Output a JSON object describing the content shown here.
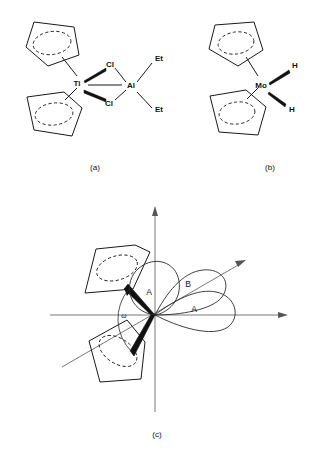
{
  "figure": {
    "background_color": "#ffffff",
    "line_color": "#1a1a1a"
  },
  "panels": [
    {
      "id": "a",
      "caption": "(a)",
      "description": "Titanocene dichloride aluminium alkyl bridged complex",
      "atoms": [
        {
          "name": "Ti",
          "label": "Ti"
        },
        {
          "name": "Cl-top",
          "label": "Cl"
        },
        {
          "name": "Cl-bottom",
          "label": "Cl"
        },
        {
          "name": "Al",
          "label": "Al"
        },
        {
          "name": "Et-top",
          "label": "Et"
        },
        {
          "name": "Et-bottom",
          "label": "Et"
        }
      ],
      "ligands": [
        {
          "name": "cp-ring-upper",
          "label": "Cp"
        },
        {
          "name": "cp-ring-lower",
          "label": "Cp"
        }
      ]
    },
    {
      "id": "b",
      "caption": "(b)",
      "description": "Molybdenocene dihydride",
      "atoms": [
        {
          "name": "Mo",
          "label": "Mo"
        },
        {
          "name": "H-top",
          "label": "H"
        },
        {
          "name": "H-bottom",
          "label": "H"
        }
      ],
      "ligands": [
        {
          "name": "cp-ring-upper",
          "label": "Cp"
        },
        {
          "name": "cp-ring-lower",
          "label": "Cp"
        }
      ]
    },
    {
      "id": "c",
      "caption": "(c)",
      "description": "Frontier orbital lobes of a bent metallocene with interannular angle omega",
      "angle_label": "ω",
      "orbital_lobes": [
        {
          "name": "lobe-upper",
          "label": "A"
        },
        {
          "name": "lobe-diagonal",
          "label": "B"
        },
        {
          "name": "lobe-right",
          "label": "A"
        }
      ],
      "axes": [
        {
          "name": "y-axis",
          "direction": "up"
        },
        {
          "name": "x-axis",
          "direction": "right"
        },
        {
          "name": "z-axis",
          "direction": "diagonal-up-right"
        }
      ],
      "ligands": [
        {
          "name": "cp-ring-upper-left",
          "label": "Cp"
        },
        {
          "name": "cp-ring-lower-left",
          "label": "Cp"
        }
      ]
    }
  ]
}
